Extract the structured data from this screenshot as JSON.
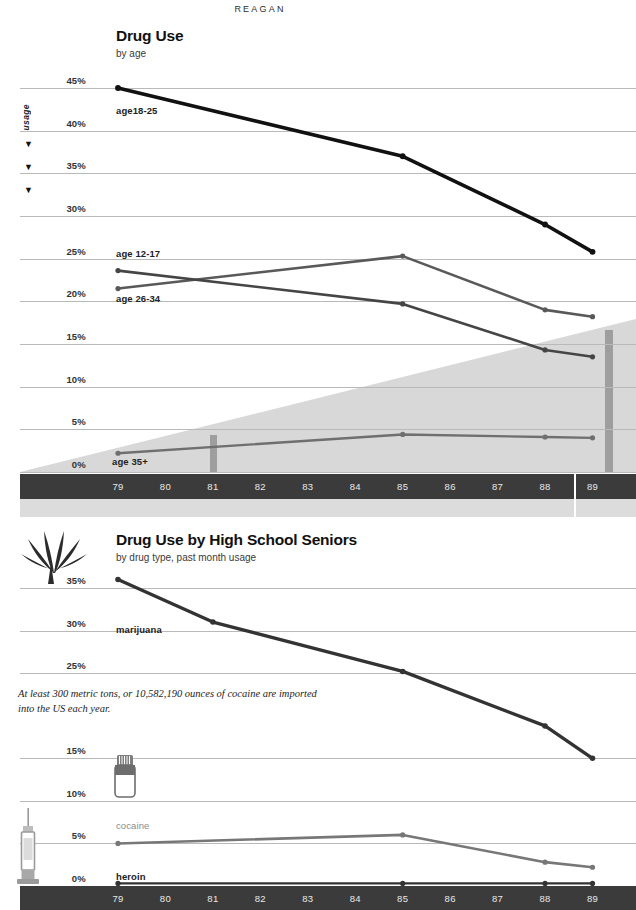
{
  "charts": [
    {
      "id": "drug-use-by-age",
      "title": "Drug Use",
      "subtitle": "by age",
      "axis_label": "usage",
      "term_label": "REAGAN",
      "chart_data": {
        "type": "line",
        "title": "Drug Use",
        "subtitle": "by age",
        "xlabel": "",
        "ylabel": "usage",
        "ylim": [
          0,
          45
        ],
        "ytick_labels": [
          "45%",
          "40%",
          "35%",
          "30%",
          "25%",
          "20%",
          "15%",
          "10%",
          "5%",
          "0%"
        ],
        "ytick_values": [
          45,
          40,
          35,
          30,
          25,
          20,
          15,
          10,
          5,
          0
        ],
        "xtick_labels": [
          "79",
          "80",
          "81",
          "82",
          "83",
          "84",
          "85",
          "86",
          "87",
          "88",
          "89"
        ],
        "x": [
          79,
          80,
          81,
          82,
          83,
          84,
          85,
          86,
          87,
          88,
          89
        ],
        "grid": true,
        "legend": "inline",
        "series": [
          {
            "name": "age18-25",
            "color": "#111111",
            "width": 3.6,
            "x": [
              79,
              85,
              88,
              89
            ],
            "values": [
              45.0,
              37.0,
              29.0,
              25.8
            ]
          },
          {
            "name": "age 12-17",
            "color": "#595959",
            "width": 2.6,
            "x": [
              79,
              85,
              88,
              89
            ],
            "values": [
              21.5,
              25.3,
              19.0,
              18.2
            ]
          },
          {
            "name": "age 26-34",
            "color": "#454545",
            "width": 2.6,
            "x": [
              79,
              85,
              88,
              89
            ],
            "values": [
              23.6,
              19.7,
              14.3,
              13.5
            ]
          },
          {
            "name": "age 35+",
            "color": "#6f6f6f",
            "width": 2.4,
            "x": [
              79,
              85,
              88,
              89
            ],
            "values": [
              2.2,
              4.4,
              4.1,
              4.0
            ]
          }
        ]
      }
    },
    {
      "id": "drug-use-high-school-seniors",
      "title": "Drug Use by High School Seniors",
      "subtitle": "by drug type, past month usage",
      "caption": "At least 300 metric tons, or 10,582,190 ounces of cocaine are imported into the US each year.",
      "chart_data": {
        "type": "line",
        "title": "Drug Use by High School Seniors",
        "subtitle": "by drug type, past month usage",
        "xlabel": "",
        "ylabel": "",
        "ylim": [
          0,
          37
        ],
        "ytick_labels": [
          "35%",
          "30%",
          "25%",
          "15%",
          "10%",
          "5%",
          "0%"
        ],
        "ytick_values": [
          35,
          30,
          25,
          15,
          10,
          5,
          0
        ],
        "xtick_labels": [
          "79",
          "80",
          "81",
          "82",
          "83",
          "84",
          "85",
          "86",
          "87",
          "88",
          "89"
        ],
        "x": [
          79,
          80,
          81,
          82,
          83,
          84,
          85,
          86,
          87,
          88,
          89
        ],
        "grid": true,
        "legend": "inline",
        "series": [
          {
            "name": "marijuana",
            "color": "#333333",
            "width": 3.4,
            "x": [
              79,
              81,
              85,
              88,
              89
            ],
            "values": [
              36.0,
              31.0,
              25.2,
              18.8,
              15.0
            ]
          },
          {
            "name": "cocaine",
            "color": "#777777",
            "width": 2.6,
            "x": [
              79,
              85,
              88,
              89
            ],
            "values": [
              5.0,
              6.0,
              2.8,
              2.2
            ]
          },
          {
            "name": "heroin",
            "color": "#333333",
            "width": 2.2,
            "x": [
              79,
              85,
              88,
              89
            ],
            "values": [
              0.3,
              0.3,
              0.3,
              0.3
            ]
          }
        ]
      }
    }
  ],
  "icons": {
    "cannabis": "cannabis-leaf-icon",
    "pills": "pill-bottle-icon",
    "syringe": "syringe-icon"
  },
  "colors": {
    "axis_band": "#3b3b3b",
    "term_band": "#dcdcdc",
    "gridline": "#b9b9b9",
    "shade": "#d8d8d8",
    "marker": "#333333"
  }
}
